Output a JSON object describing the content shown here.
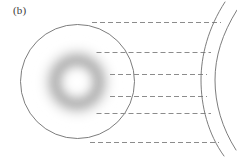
{
  "figure": {
    "panel_label": "(b)",
    "width": 237,
    "height": 158,
    "background_color": "#ffffff"
  },
  "chart_data": {
    "type": "diagram",
    "title": "(b)",
    "xlabel": "",
    "ylabel": "",
    "grid": false,
    "legend": null,
    "elements": [
      {
        "name": "source-circle",
        "kind": "circle",
        "cx": 77.5,
        "cy": 81.5,
        "r": 57,
        "stroke": "#6e6e6e",
        "stroke_width": 0.9,
        "fill": "none"
      },
      {
        "name": "blurred-ring",
        "kind": "annulus-gradient",
        "cx": 77,
        "cy": 82,
        "outer_r": 40,
        "peak_r": 27,
        "inner_r": 14,
        "color": "#9a9a9a",
        "blur": 7
      },
      {
        "name": "lens-arc-inner",
        "kind": "arc",
        "path": "M 225 2 C 208 28, 201 56, 201 80 C 201 106, 208 134, 224 156",
        "stroke": "#6e6e6e",
        "stroke_width": 0.9
      },
      {
        "name": "lens-arc-outer",
        "kind": "arc",
        "path": "M 237 10 C 222 34, 215 57, 215 80 C 215 104, 222 128, 236 150",
        "stroke": "#6e6e6e",
        "stroke_width": 0.9
      }
    ],
    "dashed_rays": [
      {
        "index": 1,
        "y": 22.5,
        "x_start": 92,
        "x_end": 221,
        "label": "ray-1"
      },
      {
        "index": 2,
        "y": 52.5,
        "x_start": 96.5,
        "x_end": 211,
        "label": "ray-2"
      },
      {
        "index": 3,
        "y": 74.5,
        "x_start": 110,
        "x_end": 207,
        "label": "ray-3"
      },
      {
        "index": 4,
        "y": 96.5,
        "x_start": 110,
        "x_end": 207,
        "label": "ray-4"
      },
      {
        "index": 5,
        "y": 113.5,
        "x_start": 96.5,
        "x_end": 211,
        "label": "ray-5"
      },
      {
        "index": 6,
        "y": 142.5,
        "x_start": 90,
        "x_end": 219,
        "label": "ray-6"
      }
    ],
    "ray_style": {
      "stroke": "#8c8c8c",
      "stroke_width": 1.0,
      "dash_array": "5 3"
    }
  }
}
